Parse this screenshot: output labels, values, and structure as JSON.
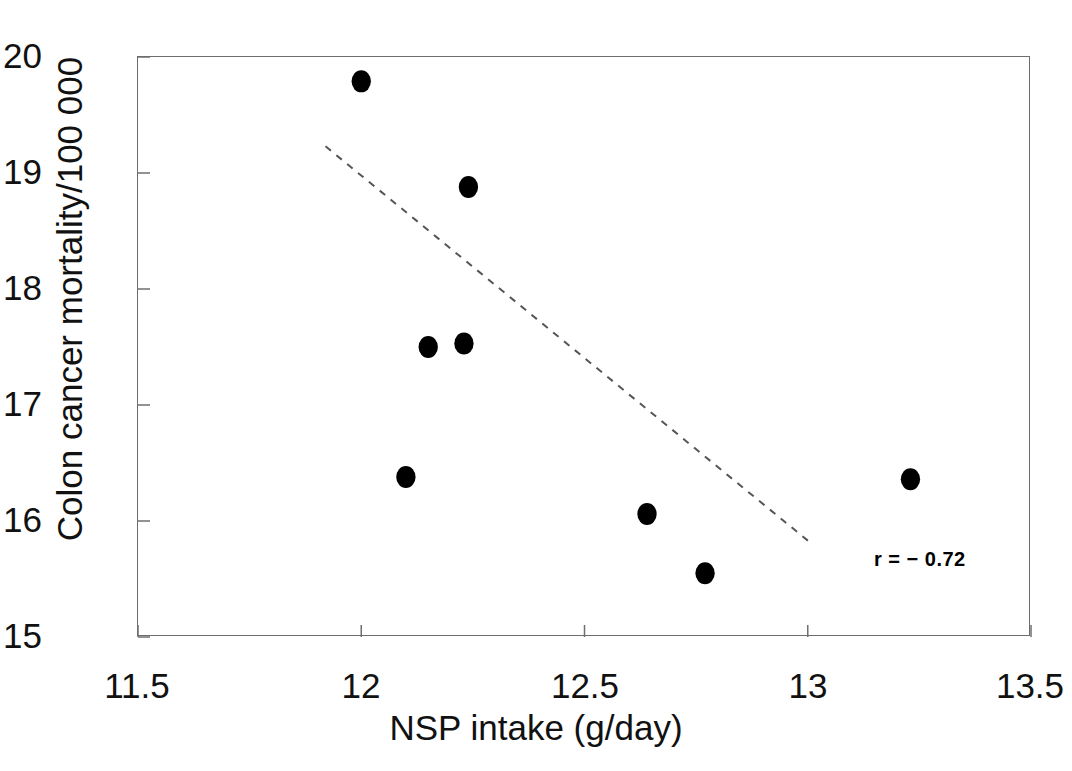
{
  "chart_data": {
    "type": "scatter",
    "title": "",
    "xlabel": "NSP intake (g/day)",
    "ylabel": "Colon cancer mortality/100 000",
    "xlim": [
      11.5,
      13.5
    ],
    "ylim": [
      15,
      20
    ],
    "xticks": [
      "11.5",
      "12",
      "12.5",
      "13",
      "13.5"
    ],
    "xtick_values": [
      11.5,
      12,
      12.5,
      13,
      13.5
    ],
    "yticks": [
      "15",
      "16",
      "17",
      "18",
      "19",
      "20"
    ],
    "ytick_values": [
      15,
      16,
      17,
      18,
      19,
      20
    ],
    "grid": false,
    "legend": null,
    "marker": {
      "shape": "circle",
      "color": "#000000",
      "size_px": 22
    },
    "points": [
      {
        "x": 12.0,
        "y": 19.79
      },
      {
        "x": 12.24,
        "y": 18.88
      },
      {
        "x": 12.15,
        "y": 17.5
      },
      {
        "x": 12.23,
        "y": 17.53
      },
      {
        "x": 12.1,
        "y": 16.38
      },
      {
        "x": 12.64,
        "y": 16.06
      },
      {
        "x": 12.77,
        "y": 15.55
      },
      {
        "x": 13.23,
        "y": 16.36
      }
    ],
    "trendline": {
      "style": "dashed",
      "color": "#555555",
      "x_start": 11.92,
      "y_start": 19.23,
      "x_end": 13.01,
      "y_end": 15.8
    },
    "annotations": [
      {
        "text": "r = − 0.72",
        "x": 13.15,
        "y": 15.72,
        "bold": true
      }
    ],
    "frame": {
      "color": "#6e6e6e",
      "visible": true
    }
  }
}
